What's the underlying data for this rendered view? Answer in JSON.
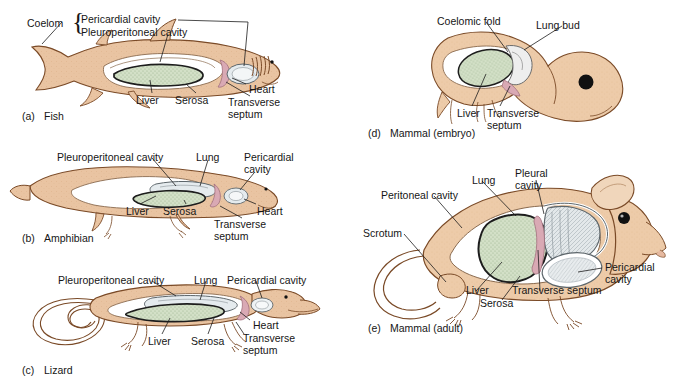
{
  "figure": {
    "kind": "comparative-anatomy-diagram",
    "background_color": "#ffffff",
    "text_color": "#161616"
  },
  "palette": {
    "body_fill": "#e9c4a2",
    "body_fill_light": "#f0d6bb",
    "body_outline": "#7a4a27",
    "liver_fill": "#d3e0c7",
    "liver_outline": "#1d1d1d",
    "lung_fill": "#dde3e6",
    "lung_outline": "#4a5358",
    "cavity_white": "#ffffff",
    "septum_pink": "#d9a9b4",
    "eye_black": "#111111",
    "leader_line": "#1d1d1d"
  },
  "panels": [
    {
      "id": "fish",
      "letter": "(a)",
      "caption": "Fish",
      "caption_pos": {
        "x": 22,
        "y": 110
      },
      "group_label": "Coelom",
      "group_label_pos": {
        "x": 27,
        "y": 18
      },
      "brace_pos": {
        "x": 72,
        "y": 11
      },
      "labels": [
        {
          "name": "pericardial-cavity",
          "text": "Pericardial cavity",
          "x": 81,
          "y": 14
        },
        {
          "name": "pleuroperitoneal-cavity",
          "text": "Pleuroperitoneal cavity",
          "x": 81,
          "y": 27
        },
        {
          "name": "liver",
          "text": "Liver",
          "x": 136,
          "y": 95
        },
        {
          "name": "serosa",
          "text": "Serosa",
          "x": 175,
          "y": 95
        },
        {
          "name": "heart",
          "text": "Heart",
          "x": 249,
          "y": 84
        },
        {
          "name": "transverse-septum",
          "text": "Transverse\nseptum",
          "x": 228,
          "y": 97
        }
      ]
    },
    {
      "id": "amphibian",
      "letter": "(b)",
      "caption": "Amphibian",
      "caption_pos": {
        "x": 22,
        "y": 232
      },
      "labels": [
        {
          "name": "pleuroperitoneal-cavity",
          "text": "Pleuroperitoneal cavity",
          "x": 57,
          "y": 152
        },
        {
          "name": "lung",
          "text": "Lung",
          "x": 196,
          "y": 152
        },
        {
          "name": "pericardial-cavity",
          "text": "Pericardial\ncavity",
          "x": 244,
          "y": 152
        },
        {
          "name": "liver",
          "text": "Liver",
          "x": 126,
          "y": 206
        },
        {
          "name": "serosa",
          "text": "Serosa",
          "x": 163,
          "y": 206
        },
        {
          "name": "heart",
          "text": "Heart",
          "x": 257,
          "y": 206
        },
        {
          "name": "transverse-septum",
          "text": "Transverse\nseptum",
          "x": 214,
          "y": 219
        }
      ]
    },
    {
      "id": "lizard",
      "letter": "(c)",
      "caption": "Lizard",
      "caption_pos": {
        "x": 22,
        "y": 364
      },
      "labels": [
        {
          "name": "pleuroperitoneal-cavity",
          "text": "Pleuroperitoneal cavity",
          "x": 58,
          "y": 275
        },
        {
          "name": "lung",
          "text": "Lung",
          "x": 194,
          "y": 275
        },
        {
          "name": "pericardial-cavity",
          "text": "Pericardial cavity",
          "x": 227,
          "y": 275
        },
        {
          "name": "liver",
          "text": "Liver",
          "x": 148,
          "y": 336
        },
        {
          "name": "serosa",
          "text": "Serosa",
          "x": 191,
          "y": 336
        },
        {
          "name": "heart",
          "text": "Heart",
          "x": 253,
          "y": 320
        },
        {
          "name": "transverse-septum",
          "text": "Transverse\nseptum",
          "x": 243,
          "y": 333
        }
      ]
    },
    {
      "id": "mammal-embryo",
      "letter": "(d)",
      "caption": "Mammal (embryo)",
      "caption_pos": {
        "x": 368,
        "y": 127
      },
      "labels": [
        {
          "name": "coelomic-fold",
          "text": "Coelomic fold",
          "x": 437,
          "y": 16
        },
        {
          "name": "lung-bud",
          "text": "Lung bud",
          "x": 536,
          "y": 20
        },
        {
          "name": "liver",
          "text": "Liver",
          "x": 457,
          "y": 108
        },
        {
          "name": "transverse-septum",
          "text": "Transverse\nseptum",
          "x": 487,
          "y": 108
        }
      ]
    },
    {
      "id": "mammal-adult",
      "letter": "(e)",
      "caption": "Mammal (adult)",
      "caption_pos": {
        "x": 368,
        "y": 322
      },
      "labels": [
        {
          "name": "lung",
          "text": "Lung",
          "x": 472,
          "y": 175
        },
        {
          "name": "pleural-cavity",
          "text": "Pleural\ncavity",
          "x": 515,
          "y": 168
        },
        {
          "name": "peritoneal-cavity",
          "text": "Peritoneal cavity",
          "x": 381,
          "y": 190
        },
        {
          "name": "scrotum",
          "text": "Scrotum",
          "x": 363,
          "y": 228
        },
        {
          "name": "pericardial-cavity",
          "text": "Pericardial\ncavity",
          "x": 605,
          "y": 262
        },
        {
          "name": "liver",
          "text": "Liver",
          "x": 466,
          "y": 285
        },
        {
          "name": "serosa",
          "text": "Serosa",
          "x": 480,
          "y": 298
        },
        {
          "name": "transverse-septum",
          "text": "Transverse septum",
          "x": 512,
          "y": 285
        }
      ]
    }
  ]
}
